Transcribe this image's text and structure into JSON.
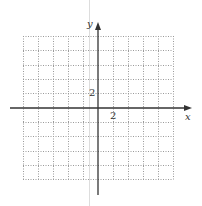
{
  "diagram": {
    "type": "coordinate-grid",
    "axes": {
      "x_label": "x",
      "y_label": "y",
      "x_tick_label": "2",
      "y_tick_label": "2"
    },
    "grid": {
      "columns": 10,
      "rows": 10,
      "unit_per_cell": 1,
      "x_range": [
        -6,
        4
      ],
      "y_range": [
        -5,
        5
      ],
      "line_style": "dotted",
      "line_color": "#9a9a9a"
    },
    "colors": {
      "axis": "#333333",
      "grid": "#9a9a9a",
      "guide_line": "#dddddd",
      "background": "#ffffff"
    }
  }
}
